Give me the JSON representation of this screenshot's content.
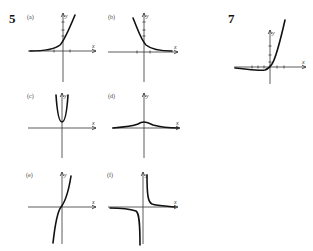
{
  "problems": [
    {
      "number": "5",
      "x": 9,
      "y": 23
    },
    {
      "number": "7",
      "x": 228,
      "y": 23
    }
  ],
  "axis_labels": {
    "x": "x",
    "y": "y"
  },
  "panels": [
    {
      "id": "a",
      "label": "(a)",
      "lx": 27,
      "ly": 19,
      "ox": 63,
      "oy": 51,
      "x0": 28,
      "x1": 96,
      "y0": 13,
      "y1": 82,
      "xticks": [
        54,
        70
      ],
      "yticks": [
        36,
        30,
        22
      ],
      "curve": "M30,51 C45,51 55,49 60,45 C64,41 68,32 75,15"
    },
    {
      "id": "b",
      "label": "(b)",
      "lx": 108,
      "ly": 19,
      "ox": 144,
      "oy": 52,
      "x0": 108,
      "x1": 178,
      "y0": 13,
      "y1": 82,
      "xticks": [
        137,
        150
      ],
      "yticks": [
        36,
        30,
        22
      ],
      "curve": "M133,18 C138,30 141,40 146,45 C152,50 160,51 172,51"
    },
    {
      "id": "c",
      "label": "(c)",
      "lx": 27,
      "ly": 98,
      "ox": 62,
      "oy": 128,
      "x0": 28,
      "x1": 96,
      "y0": 93,
      "y1": 158,
      "xticks": [],
      "yticks": [],
      "curve": "M56,95 C57,110 59,122 62,122 C65,122 67,110 68,95"
    },
    {
      "id": "d",
      "label": "(d)",
      "lx": 108,
      "ly": 98,
      "ox": 144,
      "oy": 128,
      "x0": 112,
      "x1": 180,
      "y0": 93,
      "y1": 158,
      "xticks": [],
      "yticks": [],
      "curve": "M113,128 C125,127 133,126 138,124 C141,122 143,122 144,122 C146,122 149,123 153,125 C160,127 168,128 178,128"
    },
    {
      "id": "e",
      "label": "(e)",
      "lx": 26,
      "ly": 177,
      "ox": 62,
      "oy": 207,
      "x0": 28,
      "x1": 96,
      "y0": 172,
      "y1": 244,
      "xticks": [],
      "yticks": [],
      "curve": "M53,243 C55,225 57,212 61,207 C65,202 68,195 71,176"
    },
    {
      "id": "f",
      "label": "(f)",
      "lx": 107,
      "ly": 177,
      "ox": 143,
      "oy": 207,
      "x0": 108,
      "x1": 178,
      "y0": 172,
      "y1": 244,
      "xticks": [],
      "yticks": [],
      "curve": "M147,175 C147,195 148,202 152,204 C158,206 166,206 175,207 M110,208 C122,208 130,209 136,211 C139,213 140,222 140,245"
    },
    {
      "id": "7",
      "label": "",
      "lx": 0,
      "ly": 0,
      "ox": 270,
      "oy": 67,
      "x0": 234,
      "x1": 306,
      "y0": 30,
      "y1": 84,
      "xticks": [
        252,
        258,
        264,
        277,
        284
      ],
      "yticks": [
        62,
        55,
        46
      ],
      "curve": "M235,68 C248,69 258,71 265,70 C268,69 270,67 272,64 C276,58 280,42 285,20"
    }
  ]
}
